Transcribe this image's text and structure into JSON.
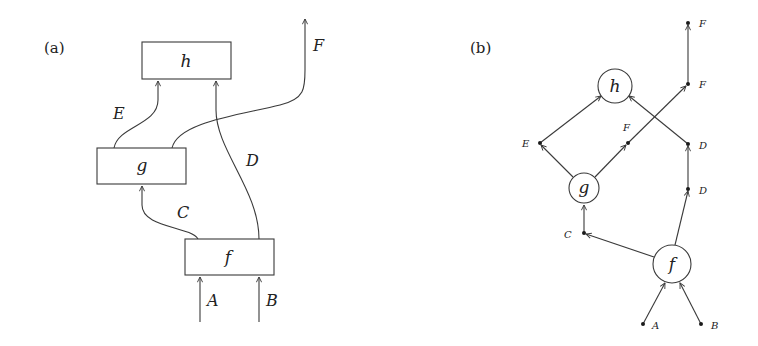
{
  "panels": {
    "a": {
      "label": "(a)",
      "boxes": {
        "h": "h",
        "g": "g",
        "f": "f"
      },
      "wires": {
        "A": "A",
        "B": "B",
        "C": "C",
        "D": "D",
        "E": "E",
        "F": "F"
      }
    },
    "b": {
      "label": "(b)",
      "nodes": {
        "h": "h",
        "g": "g",
        "f": "f"
      },
      "points": {
        "E": "E",
        "F_mid": "F",
        "F_right": "F",
        "F_top": "F",
        "D_upper": "D",
        "D_lower": "D",
        "C": "C",
        "A": "A",
        "B": "B"
      }
    }
  },
  "colors": {
    "stroke": "#3a3a3a",
    "background": "#ffffff",
    "text": "#222222"
  }
}
